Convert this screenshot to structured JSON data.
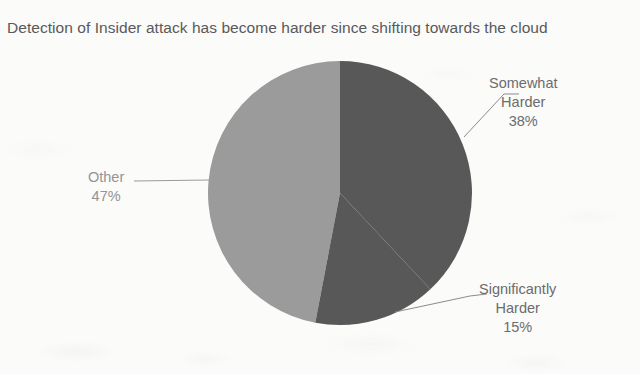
{
  "chart": {
    "title": "Detection of Insider attack has become harder since shifting towards the cloud"
  },
  "chart_data": {
    "type": "pie",
    "title": "Detection of Insider attack has become harder since shifting towards the cloud",
    "categories": [
      "Somewhat Harder",
      "Significantly Harder",
      "Other"
    ],
    "values": [
      38,
      15,
      47
    ],
    "value_labels": [
      "38%",
      "15%",
      "47%"
    ],
    "unit": "%",
    "colors": [
      "#585859",
      "#585859",
      "#9b9b9b"
    ],
    "legend": "none",
    "labels_position": "outside-with-leader-lines",
    "start_angle_deg": 0,
    "direction": "clockwise",
    "slices": [
      {
        "name": "Somewhat Harder",
        "value": 38,
        "value_label": "38%",
        "color": "#585859",
        "label_line_1": "Somewhat",
        "label_line_2": "Harder",
        "label_line_3": "38%"
      },
      {
        "name": "Significantly Harder",
        "value": 15,
        "value_label": "15%",
        "color": "#585859",
        "label_line_1": "Significantly",
        "label_line_2": "Harder",
        "label_line_3": "15%"
      },
      {
        "name": "Other",
        "value": 47,
        "value_label": "47%",
        "color": "#9b9b9b",
        "label_line_1": "Other",
        "label_line_2": "47%"
      }
    ]
  },
  "colors": {
    "background": "#fbfbfa",
    "title_text": "#59595a",
    "label_text": "#6c6c6c",
    "label_text_muted": "#949494",
    "slice_dark": "#585859",
    "slice_light": "#9b9b9b",
    "leader_line": "#8b8b8b"
  }
}
